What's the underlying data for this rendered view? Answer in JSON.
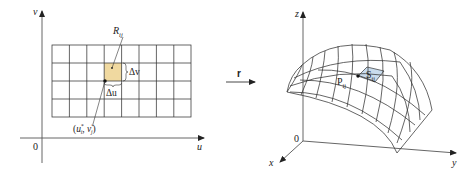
{
  "left_panel": {
    "axes": {
      "vertical_label": "v",
      "horizontal_label": "u",
      "origin_label": "0"
    },
    "grid": {
      "columns": 8,
      "rows": 4
    },
    "highlight": {
      "label": "R",
      "subscript": "ij",
      "color": "#f0d9a0"
    },
    "delta_v_label": "Δv",
    "delta_u_label": "Δu",
    "sample_point": {
      "label_open": "(",
      "u": "u",
      "u_sub": "i",
      "u_sup": "*",
      "sep": ", ",
      "v": "v",
      "v_sub": "j",
      "v_sup": "*",
      "label_close": ")"
    }
  },
  "mapping": {
    "label": "r"
  },
  "right_panel": {
    "axes": {
      "z_label": "z",
      "x_label": "x",
      "y_label": "y",
      "origin_label": "0"
    },
    "point": {
      "label": "P",
      "subscript": "ij"
    },
    "patch": {
      "label": "S",
      "subscript": "ij",
      "color": "#c9dced"
    }
  }
}
